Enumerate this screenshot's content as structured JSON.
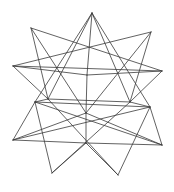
{
  "figure": {
    "stroke_color": "#3a3a3a",
    "background_color": "#ffffff",
    "vertices": {
      "T": [
        92,
        13
      ],
      "UL": [
        31,
        28
      ],
      "UR": [
        151,
        32
      ],
      "L": [
        13,
        66
      ],
      "R": [
        162,
        71
      ],
      "C1": [
        87,
        75
      ],
      "ML1": [
        35,
        102
      ],
      "ML2": [
        48,
        99
      ],
      "MR1": [
        130,
        102
      ],
      "MR2": [
        150,
        107
      ],
      "C2": [
        86,
        113
      ],
      "LL": [
        13,
        140
      ],
      "LR": [
        162,
        145
      ],
      "N": [
        86,
        143
      ],
      "BL": [
        52,
        173
      ],
      "BR": [
        118,
        175
      ]
    },
    "edges": [
      [
        "T",
        "ML2"
      ],
      [
        "T",
        "MR1"
      ],
      [
        "T",
        "C1"
      ],
      [
        "T",
        "ML1"
      ],
      [
        "T",
        "MR2"
      ],
      [
        "UL",
        "R"
      ],
      [
        "UL",
        "C2"
      ],
      [
        "UL",
        "ML2"
      ],
      [
        "UR",
        "L"
      ],
      [
        "UR",
        "C2"
      ],
      [
        "UR",
        "MR1"
      ],
      [
        "L",
        "R"
      ],
      [
        "L",
        "C1"
      ],
      [
        "L",
        "ML2"
      ],
      [
        "R",
        "C1"
      ],
      [
        "R",
        "MR1"
      ],
      [
        "C1",
        "C2"
      ],
      [
        "ML1",
        "MR2"
      ],
      [
        "ML2",
        "MR1"
      ],
      [
        "ML1",
        "LR"
      ],
      [
        "MR2",
        "LL"
      ],
      [
        "ML1",
        "LL"
      ],
      [
        "MR2",
        "LR"
      ],
      [
        "ML2",
        "BR"
      ],
      [
        "MR1",
        "BL"
      ],
      [
        "LL",
        "C2"
      ],
      [
        "LR",
        "C2"
      ],
      [
        "LL",
        "N"
      ],
      [
        "LR",
        "N"
      ],
      [
        "C2",
        "N"
      ],
      [
        "N",
        "BL"
      ],
      [
        "N",
        "BR"
      ],
      [
        "ML1",
        "BL"
      ],
      [
        "MR2",
        "BR"
      ],
      [
        "ML1",
        "ML2"
      ],
      [
        "MR1",
        "MR2"
      ]
    ]
  }
}
